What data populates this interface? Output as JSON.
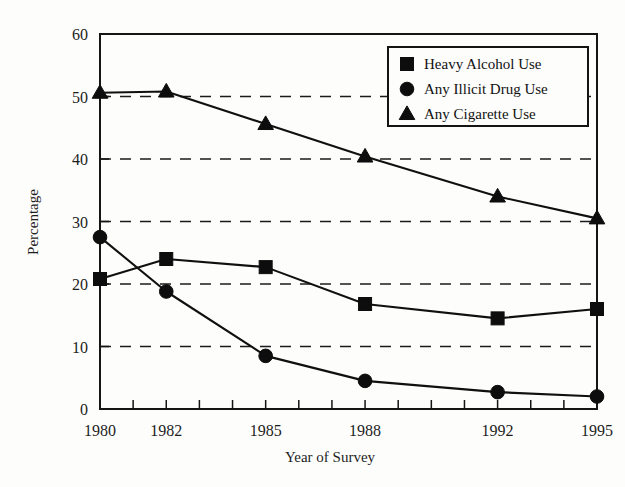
{
  "figure": {
    "background_color": "#fdfdfc",
    "ink_color": "#101010"
  },
  "axes": {
    "x_title": "Year of Survey",
    "y_title": "Percentage",
    "x_tick_labels": [
      "1980",
      "1982",
      "1985",
      "1988",
      "1992",
      "1995"
    ],
    "y_tick_labels": [
      "0",
      "10",
      "20",
      "30",
      "40",
      "50",
      "60"
    ]
  },
  "legend": {
    "items": [
      {
        "label": "Heavy Alcohol Use",
        "marker": "square-marker-icon"
      },
      {
        "label": "Any Illicit Drug Use",
        "marker": "circle-marker-icon"
      },
      {
        "label": "Any Cigarette Use",
        "marker": "triangle-marker-icon"
      }
    ]
  },
  "chart_data": {
    "type": "line",
    "title": "",
    "xlabel": "Year of Survey",
    "ylabel": "Percentage",
    "x": [
      1980,
      1982,
      1985,
      1988,
      1992,
      1995
    ],
    "xtick_labels": [
      "1980",
      "1982",
      "1985",
      "1988",
      "1992",
      "1995"
    ],
    "xlim": [
      1980,
      1995
    ],
    "ylim": [
      0,
      60
    ],
    "yticks": [
      0,
      10,
      20,
      30,
      40,
      50,
      60
    ],
    "grid": "horizontal-dashed-at-10-20-30-40-50",
    "legend_position": "top-right-inside",
    "series": [
      {
        "name": "Heavy Alcohol Use",
        "marker": "square",
        "values": [
          20.8,
          24.0,
          22.7,
          16.8,
          14.5,
          16.0
        ]
      },
      {
        "name": "Any Illicit Drug Use",
        "marker": "circle",
        "values": [
          27.5,
          18.8,
          8.5,
          4.5,
          2.7,
          2.0
        ]
      },
      {
        "name": "Any Cigarette Use",
        "marker": "triangle",
        "values": [
          50.6,
          50.8,
          45.6,
          40.4,
          34.0,
          30.5
        ]
      }
    ]
  }
}
